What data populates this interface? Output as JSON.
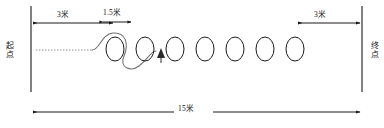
{
  "diagram": {
    "type": "sports-course-layout",
    "labels": {
      "start": "起点",
      "end": "终点",
      "dim_left": "3米",
      "dim_mid": "1.5米",
      "dim_right": "3米",
      "dim_total": "15米"
    },
    "colors": {
      "line": "#1a1a1a",
      "path": "#6b6b6b",
      "background": "#ffffff"
    },
    "cones": {
      "count": 7,
      "shape": "ellipse",
      "centers_x": [
        115,
        145,
        175,
        205,
        235,
        265,
        295
      ],
      "center_y": 49,
      "rx": 9,
      "ry": 12
    },
    "dimensions": [
      {
        "name": "start-to-first-cone",
        "value": "3米",
        "from_x": 31,
        "to_x": 115,
        "y": 23
      },
      {
        "name": "cone-spacing",
        "value": "1.5米",
        "from_x": 102,
        "to_x": 132,
        "y": 21
      },
      {
        "name": "last-cone-to-finish",
        "value": "3米",
        "from_x": 295,
        "to_x": 362,
        "y": 23
      },
      {
        "name": "total-course-length",
        "value": "15米",
        "from_x": 31,
        "to_x": 362,
        "y": 112
      }
    ],
    "lines": [
      {
        "name": "start-line",
        "x": 31,
        "y1": 6,
        "y2": 92
      },
      {
        "name": "finish-line",
        "x": 362,
        "y1": 6,
        "y2": 92
      }
    ],
    "runner_path": {
      "name": "slalom-route",
      "style": "dotted-then-solid-curve",
      "arrow_direction": "up"
    }
  }
}
